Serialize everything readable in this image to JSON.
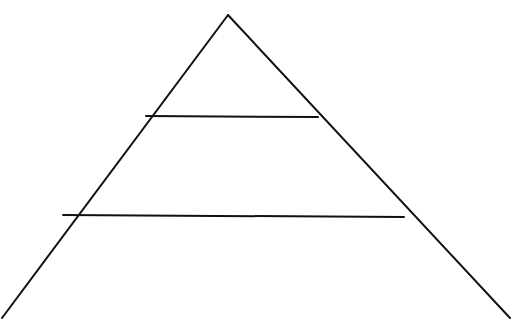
{
  "diagram": {
    "type": "pyramid",
    "tiers": 3,
    "stroke_color": "#111111",
    "background_color": "#ffffff",
    "stroke_width": 2,
    "apex": {
      "x": 228,
      "y": 15
    },
    "base_left": {
      "x": 2,
      "y": 318
    },
    "base_right": {
      "x": 510,
      "y": 318
    },
    "dividers": [
      {
        "y_left": 116,
        "x_left": 146,
        "y_right": 117,
        "x_right": 318
      },
      {
        "y_left": 215,
        "x_left": 63,
        "y_right": 217,
        "x_right": 404
      }
    ],
    "tier_labels": [
      "",
      "",
      ""
    ]
  }
}
